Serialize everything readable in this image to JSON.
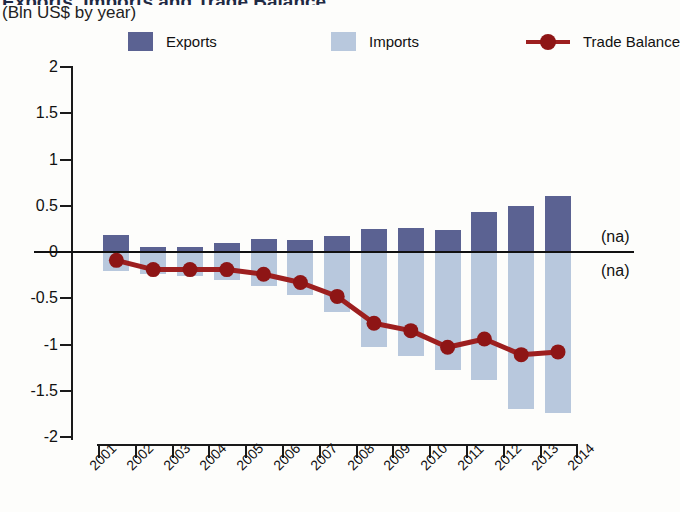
{
  "header": {
    "title_partial": "Exports, Imports and Trade Balance",
    "subtitle": "(Bln US$ by year)"
  },
  "legend": {
    "items": [
      {
        "label": "Exports",
        "type": "swatch",
        "color": "#5b6292"
      },
      {
        "label": "Imports",
        "type": "swatch",
        "color": "#b8c8dd"
      },
      {
        "label": "Trade Balance",
        "type": "line",
        "color": "#9d1f1f"
      }
    ]
  },
  "annotations": {
    "na_top": "(na)",
    "na_bottom": "(na)"
  },
  "chart_data": {
    "type": "bar",
    "title": "Exports, Imports and Trade Balance",
    "subtitle": "(Bln US$ by year)",
    "xlabel": "",
    "ylabel": "",
    "ylim": [
      -2,
      2
    ],
    "ytick_labels": [
      "2",
      "1.5",
      "1",
      "0.5",
      "0",
      "-0.5",
      "-1",
      "-1.5",
      "-2"
    ],
    "ytick_values": [
      2,
      1.5,
      1,
      0.5,
      0,
      -0.5,
      -1,
      -1.5,
      -2
    ],
    "grid": false,
    "legend_position": "top",
    "categories": [
      "2001",
      "2002",
      "2003",
      "2004",
      "2005",
      "2006",
      "2007",
      "2008",
      "2009",
      "2010",
      "2011",
      "2012",
      "2013",
      "2014"
    ],
    "series": [
      {
        "name": "Exports",
        "type": "bar",
        "color": "#5b6292",
        "values": [
          0.18,
          0.05,
          0.05,
          0.1,
          0.14,
          0.13,
          0.17,
          0.25,
          0.26,
          0.24,
          0.43,
          0.5,
          0.61,
          null
        ]
      },
      {
        "name": "Imports",
        "type": "bar",
        "color": "#b8c8dd",
        "values": [
          -0.21,
          -0.24,
          -0.26,
          -0.3,
          -0.37,
          -0.46,
          -0.65,
          -1.03,
          -1.12,
          -1.28,
          -1.38,
          -1.7,
          -1.74,
          null
        ]
      },
      {
        "name": "Trade Balance",
        "type": "line",
        "color": "#9d1f1f",
        "values": [
          -0.09,
          -0.19,
          -0.19,
          -0.19,
          -0.24,
          -0.33,
          -0.48,
          -0.77,
          -0.85,
          -1.03,
          -0.94,
          -1.11,
          -1.08,
          null
        ]
      }
    ]
  }
}
